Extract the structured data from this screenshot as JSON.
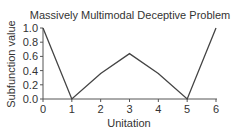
{
  "chart_data": {
    "type": "line",
    "title": "Massively Multimodal Deceptive Problem",
    "xlabel": "Unitation",
    "ylabel": "Subfunction value",
    "x": [
      0,
      1,
      2,
      3,
      4,
      5,
      6
    ],
    "series": [
      {
        "name": "Subfunction value",
        "values": [
          1.0,
          0.0,
          0.36,
          0.64,
          0.36,
          0.0,
          1.0
        ]
      }
    ],
    "xlim": [
      0,
      6
    ],
    "ylim": [
      0.0,
      1.0
    ],
    "xticks": [
      "0",
      "1",
      "2",
      "3",
      "4",
      "5",
      "6"
    ],
    "yticks": [
      "0.0",
      "0.2",
      "0.4",
      "0.6",
      "0.8",
      "1.0"
    ],
    "grid": false,
    "legend": null
  },
  "colors": {
    "line": "#444444",
    "axis": "#555555",
    "text": "#333333"
  }
}
